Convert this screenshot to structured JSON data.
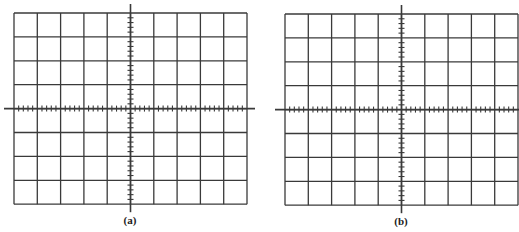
{
  "figure": {
    "line_color": "#3a3a3a",
    "panels": [
      {
        "id": "a",
        "label": "(a)",
        "origin_x": 14,
        "origin_y": 13,
        "cols": 10,
        "rows": 8,
        "cell_w": 23.3,
        "cell_h": 23.9,
        "minor_ticks_per_division": 5
      },
      {
        "id": "b",
        "label": "(b)",
        "origin_x": 285,
        "origin_y": 14,
        "cols": 10,
        "rows": 8,
        "cell_w": 23.3,
        "cell_h": 23.9,
        "minor_ticks_per_division": 5
      }
    ]
  }
}
